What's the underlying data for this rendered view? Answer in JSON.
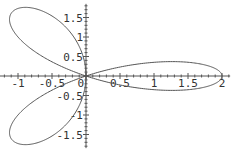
{
  "chart_data": {
    "type": "line",
    "title": "",
    "xlabel": "",
    "ylabel": "",
    "equation": "r = 2 cos(3θ)",
    "theta_range": [
      0,
      3.14159
    ],
    "xlim": [
      -1.27,
      2.12
    ],
    "ylim": [
      -1.85,
      1.85
    ],
    "x_ticks": [
      {
        "value": -1,
        "label": "-1"
      },
      {
        "value": -0.5,
        "label": "-0.5"
      },
      {
        "value": 0,
        "label": "0"
      },
      {
        "value": 0.5,
        "label": "0.5"
      },
      {
        "value": 1,
        "label": "1"
      },
      {
        "value": 1.5,
        "label": "1.5"
      },
      {
        "value": 2,
        "label": "2"
      }
    ],
    "y_ticks": [
      {
        "value": 1.5,
        "label": "1.5"
      },
      {
        "value": 1,
        "label": "1"
      },
      {
        "value": 0.5,
        "label": "0.5"
      },
      {
        "value": -0.5,
        "label": "-0.5"
      },
      {
        "value": -1,
        "label": "-1"
      },
      {
        "value": -1.5,
        "label": "-1.5"
      }
    ],
    "petal_tips": [
      [
        2,
        0
      ],
      [
        -1,
        1.732
      ],
      [
        -1,
        -1.732
      ]
    ],
    "grid": false,
    "legend": "none",
    "curve_color": "#555555"
  }
}
